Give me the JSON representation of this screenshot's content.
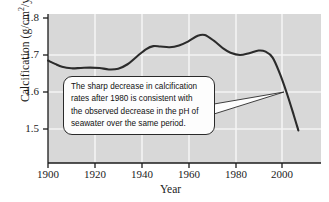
{
  "chart_data": {
    "type": "line",
    "title": "",
    "xlabel": "Year",
    "ylabel": "Calcification (g/cm2/yr)",
    "ylabel_main": "Calcification (g/cm",
    "ylabel_sup": "2",
    "ylabel_tail": "/yr)",
    "xlim": [
      1900,
      2010
    ],
    "ylim": [
      1.44,
      1.8
    ],
    "xticks": [
      1900,
      1920,
      1940,
      1960,
      1980,
      2000
    ],
    "yticks": [
      1.5,
      1.6,
      1.7,
      1.8
    ],
    "xtick_labels": [
      "1900",
      "1920",
      "1940",
      "1960",
      "1980",
      "2000"
    ],
    "ytick_labels": [
      "1.5",
      "1.6",
      "1.7",
      "1.8"
    ],
    "grid": true,
    "grid_color": "#f2f2f2",
    "plot_bgcolor": "#d8d8d8",
    "line_color": "#2b2b2b",
    "legend": null,
    "series": [
      {
        "name": "Coral calcification rate",
        "x": [
          1900,
          1903,
          1906,
          1910,
          1914,
          1918,
          1922,
          1926,
          1930,
          1934,
          1938,
          1942,
          1945,
          1948,
          1952,
          1956,
          1960,
          1964,
          1967,
          1971,
          1975,
          1978,
          1982,
          1986,
          1990,
          1993,
          1996,
          1999,
          2002,
          2005,
          2007
        ],
        "values": [
          1.685,
          1.676,
          1.668,
          1.664,
          1.665,
          1.666,
          1.665,
          1.661,
          1.663,
          1.675,
          1.696,
          1.716,
          1.724,
          1.723,
          1.721,
          1.726,
          1.737,
          1.752,
          1.754,
          1.738,
          1.717,
          1.706,
          1.7,
          1.705,
          1.712,
          1.709,
          1.693,
          1.651,
          1.598,
          1.538,
          1.496
        ]
      }
    ],
    "annotations": [
      {
        "name": "callout-annotation",
        "lines": [
          "The sharp decrease in calcification",
          "rates after 1980 is consistent with",
          "the observed decrease in the pH of",
          "seawater over the same period."
        ],
        "pointer_target_year": 1999,
        "pointer_target_value": 1.6
      }
    ]
  },
  "axes": {
    "x_title": "Year",
    "y_title_prefix": "Calcification (g/cm",
    "y_title_sup": "2",
    "y_title_suffix": "/yr)"
  }
}
